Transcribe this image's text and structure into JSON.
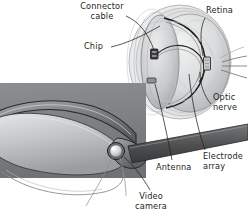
{
  "figure": {
    "background_color": "#ffffff",
    "ink_color": "#231f20",
    "width": 248,
    "height": 224
  },
  "labels": {
    "connector_cable": "Connector\ncable",
    "retina": "Retina",
    "chip": "Chip",
    "optic_nerve": "Optic\nnerve",
    "electrode_array": "Electrode\narray",
    "antenna": "Antenna",
    "video_camera": "Video\ncamera"
  },
  "parts": [
    {
      "id": "connector-cable",
      "label": "Connector cable",
      "callout": "upper-left"
    },
    {
      "id": "chip",
      "label": "Chip",
      "callout": "left"
    },
    {
      "id": "retina",
      "label": "Retina",
      "callout": "upper-right"
    },
    {
      "id": "optic-nerve",
      "label": "Optic nerve",
      "callout": "right"
    },
    {
      "id": "electrode-array",
      "label": "Electrode array",
      "callout": "lower-right"
    },
    {
      "id": "antenna",
      "label": "Antenna",
      "callout": "lower-center"
    },
    {
      "id": "video-camera",
      "label": "Video camera",
      "callout": "lower-left"
    }
  ],
  "artwork": {
    "eyeball": "cut-away sphere with layered translucent shells, sclera, vitreous body",
    "spectacles": "eyeglasses frame in three-quarter view with temple arm",
    "backdrop_panel": "mid-gray rectangular panel behind the spectacles",
    "temple_band": "dark gray band of the eyeglasses temple arm crossing to right edge",
    "colors": {
      "panel_gray": "#7f8183",
      "temple_dark": "#58595b",
      "lens_light": "#c9cbcc",
      "eye_shell": "#d5d7d8",
      "outline": "#231f20"
    }
  }
}
